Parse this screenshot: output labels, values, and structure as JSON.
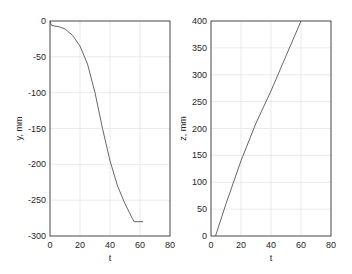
{
  "chart_data": [
    {
      "type": "line",
      "title": "",
      "xlabel": "t",
      "ylabel": "y, mm",
      "xlim": [
        0,
        80
      ],
      "ylim": [
        -300,
        0
      ],
      "xticks": [
        0,
        20,
        40,
        60,
        80
      ],
      "yticks": [
        0,
        -50,
        -100,
        -150,
        -200,
        -250,
        -300
      ],
      "grid": true,
      "series": [
        {
          "name": "y",
          "x": [
            0,
            1,
            3,
            6,
            10,
            15,
            20,
            25,
            30,
            35,
            40,
            45,
            50,
            56,
            62
          ],
          "values": [
            0,
            -6,
            -7,
            -8,
            -11,
            -20,
            -35,
            -60,
            -100,
            -150,
            -195,
            -230,
            -255,
            -280,
            -280
          ]
        }
      ]
    },
    {
      "type": "line",
      "title": "",
      "xlabel": "t",
      "ylabel": "z, mm",
      "xlim": [
        0,
        80
      ],
      "ylim": [
        0,
        400
      ],
      "xticks": [
        0,
        20,
        40,
        60,
        80
      ],
      "yticks": [
        0,
        50,
        100,
        150,
        200,
        250,
        300,
        350,
        400
      ],
      "grid": true,
      "series": [
        {
          "name": "z",
          "x": [
            3,
            10,
            20,
            30,
            40,
            50,
            60
          ],
          "values": [
            0,
            60,
            140,
            210,
            270,
            335,
            400
          ]
        }
      ]
    }
  ]
}
